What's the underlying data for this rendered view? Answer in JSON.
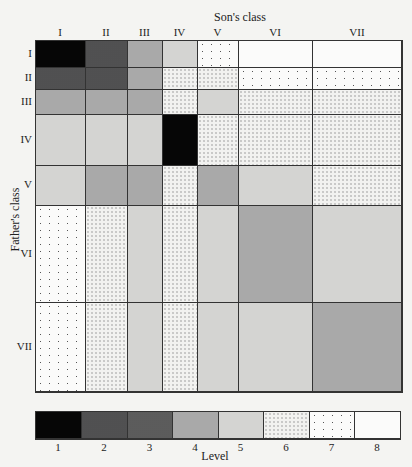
{
  "chart_data": {
    "type": "heatmap",
    "subtype": "mosaic",
    "title": "",
    "xlabel": "Son's class",
    "ylabel": "Father's class",
    "x_categories": [
      "I",
      "II",
      "III",
      "IV",
      "V",
      "VI",
      "VII"
    ],
    "y_categories": [
      "I",
      "II",
      "III",
      "IV",
      "V",
      "VI",
      "VII"
    ],
    "column_boundaries_px": [
      35,
      85,
      127,
      162,
      197,
      238,
      312,
      402
    ],
    "row_boundaries_px": [
      40,
      67,
      89,
      114,
      165,
      205,
      302,
      392
    ],
    "levels": [
      [
        1,
        2,
        4,
        5,
        7,
        8,
        8
      ],
      [
        2,
        2,
        4,
        6,
        6,
        7,
        7
      ],
      [
        4,
        4,
        4,
        6,
        5,
        6,
        6
      ],
      [
        5,
        5,
        5,
        1,
        6,
        6,
        6
      ],
      [
        5,
        4,
        4,
        6,
        4,
        5,
        6
      ],
      [
        7,
        6,
        5,
        6,
        5,
        4,
        5
      ],
      [
        7,
        6,
        5,
        6,
        5,
        5,
        4
      ]
    ],
    "legend": {
      "title": "Level",
      "entries": [
        "1",
        "2",
        "3",
        "4",
        "5",
        "6",
        "7",
        "8"
      ],
      "position": "bottom"
    },
    "grid": true
  },
  "labels": {
    "x_title": "Son's class",
    "y_title": "Father's class",
    "cols": [
      "I",
      "II",
      "III",
      "IV",
      "V",
      "VI",
      "VII"
    ],
    "rows": [
      "I",
      "II",
      "III",
      "IV",
      "V",
      "VI",
      "VII"
    ],
    "legend_title": "Level",
    "legend_ticks": [
      "1",
      "2",
      "3",
      "4",
      "5",
      "6",
      "7",
      "8"
    ]
  }
}
